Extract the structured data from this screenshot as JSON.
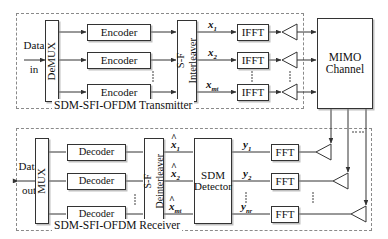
{
  "figure": {
    "type": "block-diagram",
    "sections": [
      {
        "id": "transmitter",
        "caption": "SDM-SFI-OFDM Transmitter"
      },
      {
        "id": "receiver",
        "caption": "SDM-SFI-OFDM Receiver"
      }
    ]
  },
  "transmitter": {
    "caption": "SDM-SFI-OFDM Transmitter",
    "input_label_line1": "Data",
    "input_label_line2": "in",
    "demux": "DeMUX",
    "encoders": [
      {
        "label": "Encoder"
      },
      {
        "label": "Encoder"
      },
      {
        "label": "Encoder"
      }
    ],
    "interleaver_line1": "S-F",
    "interleaver_line2": "Interleaver",
    "signals": [
      {
        "base": "x",
        "sub": "1",
        "subsub": ""
      },
      {
        "base": "x",
        "sub": "2",
        "subsub": ""
      },
      {
        "base": "x",
        "sub": "m",
        "subsub": "t"
      }
    ],
    "ifft": [
      {
        "label": "IFFT"
      },
      {
        "label": "IFFT"
      },
      {
        "label": "IFFT"
      }
    ],
    "antenna_name": "transmit-antenna"
  },
  "channel": {
    "line1": "MIMO",
    "line2": "Channel"
  },
  "receiver": {
    "caption": "SDM-SFI-OFDM Receiver",
    "output_label_line1": "Data",
    "output_label_line2": "out",
    "mux": "MUX",
    "decoders": [
      {
        "label": "Decoder"
      },
      {
        "label": "Decoder"
      },
      {
        "label": "Decoder"
      }
    ],
    "deinterleaver_line1": "S-F",
    "deinterleaver_line2": "Deinterleaver",
    "estimates": [
      {
        "base": "x",
        "hat": "^",
        "sub": "1",
        "subsub": ""
      },
      {
        "base": "x",
        "hat": "^",
        "sub": "2",
        "subsub": ""
      },
      {
        "base": "x",
        "hat": "^",
        "sub": "m",
        "subsub": "t"
      }
    ],
    "detector_line1": "SDM",
    "detector_line2": "Detector",
    "received": [
      {
        "base": "y",
        "sub": "1",
        "subsub": ""
      },
      {
        "base": "y",
        "sub": "2",
        "subsub": ""
      },
      {
        "base": "y",
        "sub": "n",
        "subsub": "r"
      }
    ],
    "fft": [
      {
        "label": "FFT"
      },
      {
        "label": "FFT"
      },
      {
        "label": "FFT"
      }
    ],
    "antenna_name": "receive-antenna"
  },
  "colors": {
    "line": "#333333",
    "dashed_border": "#8a8a8a",
    "block_fill": "#ffffff",
    "shadow": "#8c8c8c",
    "text": "#111111"
  }
}
